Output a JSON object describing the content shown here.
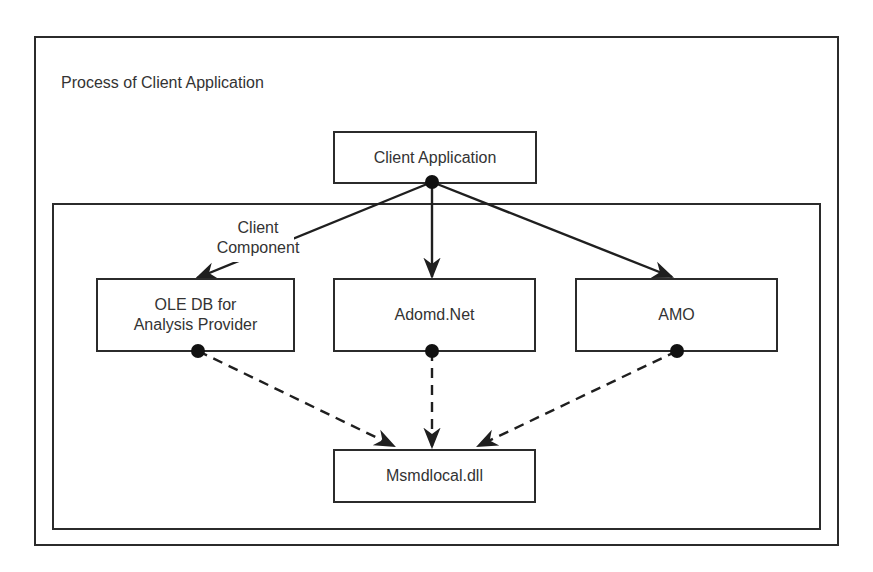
{
  "diagram": {
    "outer_container": {
      "title": "Process of Client Application"
    },
    "inner_container": {
      "label": "Client Component"
    },
    "nodes": {
      "client_application": "Client Application",
      "ole_db": {
        "line1": "OLE DB for",
        "line2": "Analysis Provider"
      },
      "adomd_net": "Adomd.Net",
      "amo": "AMO",
      "msmdlocal": "Msmdlocal.dll"
    },
    "edges": [
      {
        "from": "Client Application",
        "to": "OLE DB for Analysis Provider",
        "style": "solid"
      },
      {
        "from": "Client Application",
        "to": "Adomd.Net",
        "style": "solid"
      },
      {
        "from": "Client Application",
        "to": "AMO",
        "style": "solid"
      },
      {
        "from": "OLE DB for Analysis Provider",
        "to": "Msmdlocal.dll",
        "style": "dashed"
      },
      {
        "from": "Adomd.Net",
        "to": "Msmdlocal.dll",
        "style": "dashed"
      },
      {
        "from": "AMO",
        "to": "Msmdlocal.dll",
        "style": "dashed"
      }
    ],
    "colors": {
      "stroke": "#2b2b2b",
      "background": "#ffffff",
      "text": "#333333"
    }
  }
}
